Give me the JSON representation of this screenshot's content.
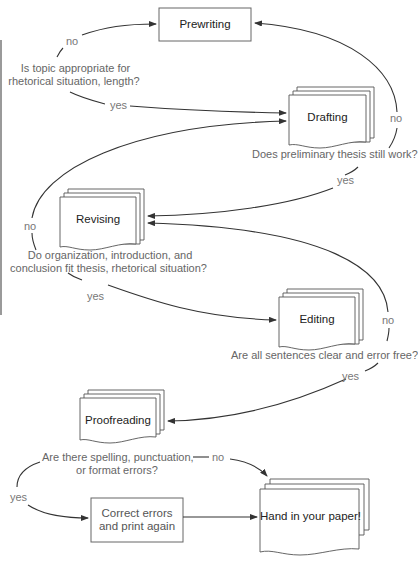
{
  "diagram": {
    "type": "flowchart",
    "nodes": {
      "prewriting": "Prewriting",
      "drafting": "Drafting",
      "revising": "Revising",
      "editing": "Editing",
      "proofreading": "Proofreading",
      "correct_line1": "Correct errors",
      "correct_line2": "and print again",
      "hand_in": "Hand in your paper!"
    },
    "questions": {
      "q1_line1": "Is topic appropriate for",
      "q1_line2": "rhetorical situation, length?",
      "q2": "Does preliminary thesis still work?",
      "q3_line1": "Do organization, introduction, and",
      "q3_line2": "conclusion fit thesis, rhetorical situation?",
      "q4": "Are all sentences clear and error free?",
      "q5_line1": "Are there spelling, punctuation,",
      "q5_line2": "or format errors?"
    },
    "branches": {
      "q1_no": "no",
      "q1_yes": "yes",
      "q2_no": "no",
      "q2_yes": "yes",
      "q3_no": "no",
      "q3_yes": "yes",
      "q4_no": "no",
      "q4_yes": "yes",
      "q5_no": "no",
      "q5_yes": "yes"
    },
    "edges": [
      {
        "from": "q1",
        "label": "no",
        "to": "Prewriting"
      },
      {
        "from": "q1",
        "label": "yes",
        "to": "Drafting"
      },
      {
        "from": "q2",
        "label": "no",
        "to": "Prewriting"
      },
      {
        "from": "q2",
        "label": "yes",
        "to": "Revising"
      },
      {
        "from": "q3",
        "label": "no",
        "to": "Drafting"
      },
      {
        "from": "q3",
        "label": "yes",
        "to": "Editing"
      },
      {
        "from": "q4",
        "label": "no",
        "to": "Revising"
      },
      {
        "from": "q4",
        "label": "yes",
        "to": "Proofreading"
      },
      {
        "from": "q5",
        "label": "no",
        "to": "Hand in your paper!"
      },
      {
        "from": "q5",
        "label": "yes",
        "to": "Correct errors and print again"
      },
      {
        "from": "Correct errors and print again",
        "label": "",
        "to": "Hand in your paper!"
      }
    ],
    "colors": {
      "stroke": "#333333",
      "box_stroke": "#555555",
      "question_text": "#666666",
      "node_text": "#222222"
    }
  }
}
